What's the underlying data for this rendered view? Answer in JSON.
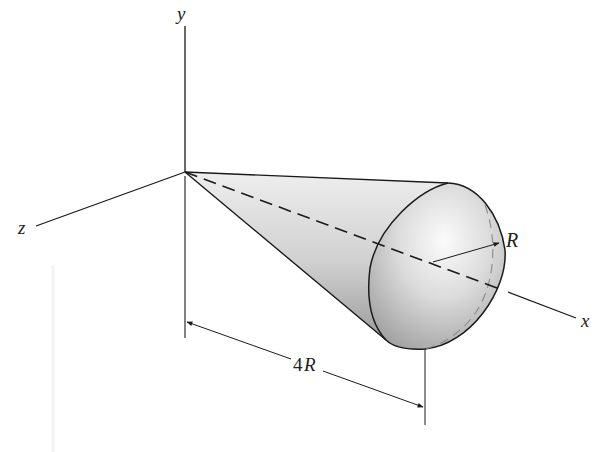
{
  "figure": {
    "type": "3D geometry diagram"
  },
  "axes": {
    "y": {
      "label": "y"
    },
    "z": {
      "label": "z"
    },
    "x": {
      "label": "x"
    }
  },
  "annotations": {
    "radius_label": "R",
    "dimension_number": "4",
    "dimension_symbol": "R"
  },
  "colors": {
    "line": "#1a1a1a",
    "shade_light": "#f4f4f4",
    "shade_mid": "#d6d6d6",
    "shade_dark": "#a9a9a9",
    "background": "#ffffff"
  }
}
